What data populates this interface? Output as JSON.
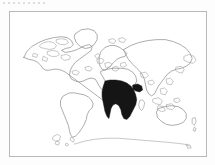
{
  "figure": {
    "type": "world-map",
    "title": "",
    "caption": "",
    "frame_color": "#b9b9b9",
    "background_color": "#ffffff",
    "page_background_color": "#fdfdfd",
    "outline_color": "#8e8e8e",
    "highlight_color": "#151515",
    "projection": "equirectangular"
  },
  "artifact": {
    "top_rule_label": "",
    "description": "faint dashed scan artifact"
  },
  "map": {
    "highlighted_region_name": "Sub-Saharan Africa",
    "highlighted_continent": "Africa",
    "regions": [
      {
        "name": "North America",
        "filled": false
      },
      {
        "name": "Greenland",
        "filled": false
      },
      {
        "name": "South America",
        "filled": false
      },
      {
        "name": "Europe",
        "filled": false
      },
      {
        "name": "Africa",
        "filled": true
      },
      {
        "name": "Asia",
        "filled": false
      },
      {
        "name": "Australia",
        "filled": false
      },
      {
        "name": "New Zealand",
        "filled": false
      },
      {
        "name": "Madagascar",
        "filled": false
      },
      {
        "name": "Antarctica",
        "filled": false
      }
    ]
  }
}
